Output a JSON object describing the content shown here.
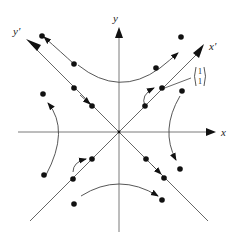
{
  "diagram": {
    "title": "",
    "type": "phase-portrait-saddle",
    "labels": {
      "x_axis": "x",
      "y_axis": "y",
      "x_prime_axis": "x′",
      "y_prime_axis": "y′",
      "eigenvector_top": "1",
      "eigenvector_bottom": "1"
    },
    "colors": {
      "axis": "#7a7a7a",
      "trajectory": "#444444",
      "point": "#111111"
    }
  }
}
